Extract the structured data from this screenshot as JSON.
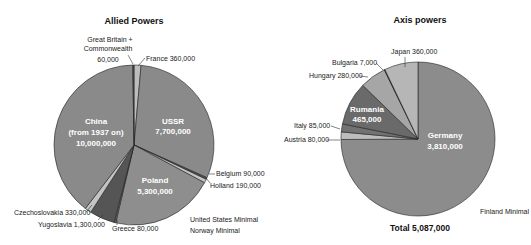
{
  "chart_data": [
    {
      "type": "pie",
      "title": "Allied Powers",
      "slices": [
        {
          "label": "France",
          "value": 360000,
          "value_text": "360,000",
          "color": "#bdbdbd"
        },
        {
          "label": "USSR",
          "value": 7700000,
          "value_text": "7,700,000",
          "color": "#8a8a8a"
        },
        {
          "label": "Belgium",
          "value": 90000,
          "value_text": "90,000",
          "color": "#555555"
        },
        {
          "label": "Holland",
          "value": 190000,
          "value_text": "190,000",
          "color": "#c4c4c4"
        },
        {
          "label": "Poland",
          "value": 5300000,
          "value_text": "5,300,000",
          "color": "#8e8e8e"
        },
        {
          "label": "Greece",
          "value": 80000,
          "value_text": "80,000",
          "color": "#6e6e6e"
        },
        {
          "label": "Yugoslavia",
          "value": 1300000,
          "value_text": "1,300,000",
          "color": "#555555"
        },
        {
          "label": "Czechoslovakia",
          "value": 330000,
          "value_text": "330,000",
          "color": "#c4c4c4"
        },
        {
          "label": "China (from 1937 on)",
          "value": 10000000,
          "value_text": "10,000,000",
          "color": "#8a8a8a"
        },
        {
          "label": "Great Britain + Commonwealth",
          "value": 60000,
          "value_text": "60,000",
          "color": "#555555"
        }
      ],
      "notes": [
        "United States  Minimal",
        "Norway  Minimal"
      ]
    },
    {
      "type": "pie",
      "title": "Axis powers",
      "slices": [
        {
          "label": "Germany",
          "value": 3810000,
          "value_text": "3,810,000",
          "color": "#8c8c8c"
        },
        {
          "label": "Austria",
          "value": 80000,
          "value_text": "80,000",
          "color": "#bdbdbd"
        },
        {
          "label": "Italy",
          "value": 85000,
          "value_text": "85,000",
          "color": "#727272"
        },
        {
          "label": "Rumania",
          "value": 465000,
          "value_text": "465,000",
          "color": "#6a6a6a"
        },
        {
          "label": "Hungary",
          "value": 280000,
          "value_text": "280,000",
          "color": "#a6a6a6"
        },
        {
          "label": "Bulgaria",
          "value": 7000,
          "value_text": "7,000",
          "color": "#333333"
        },
        {
          "label": "Japan",
          "value": 360000,
          "value_text": "360,000",
          "color": "#b6b6b6"
        }
      ],
      "total_label": "Total  5,087,000",
      "total": 5087000,
      "notes": [
        "Finland Minimal"
      ]
    }
  ],
  "labels": {
    "allied_title": "Allied Powers",
    "axis_title": "Axis powers",
    "gb_line1": "Great Britain +",
    "gb_line2": "Commonwealth",
    "gb_value": "60,000",
    "france": "France  360,000",
    "ussr_name": "USSR",
    "ussr_value": "7,700,000",
    "china_name": "China",
    "china_sub": "(from 1937 on)",
    "china_value": "10,000,000",
    "poland_name": "Poland",
    "poland_value": "5,300,000",
    "belgium": "Belgium  90,000",
    "holland": "Holland  190,000",
    "czech": "Czechoslovakia 330,000",
    "yugoslavia": "Yugoslavia  1,300,000",
    "greece": "Greece  80,000",
    "us_minimal": "United States  Minimal",
    "norway_minimal": "Norway  Minimal",
    "japan": "Japan 360,000",
    "bulgaria": "Bulgaria 7,000",
    "hungary": "Hungary 280,000",
    "rumania_name": "Rumania",
    "rumania_value": "465,000",
    "italy": "Italy 85,000",
    "austria": "Austria 80,000",
    "germany_name": "Germany",
    "germany_value": "3,810,000",
    "finland_minimal": "Finland Minimal",
    "total": "Total  5,087,000"
  }
}
